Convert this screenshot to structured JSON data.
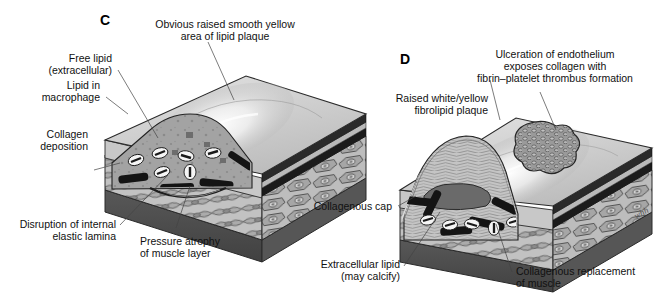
{
  "figure": {
    "signature": "whh",
    "colors": {
      "background": "#ffffff",
      "top_surface_light": "#e8e8e8",
      "top_surface_mid": "#c9c9c9",
      "highlight": "#fdfdfd",
      "muscle_layer": "#b5b5b5",
      "muscle_cell": "#9a9a9a",
      "adventitia_base": "#4a4a4a",
      "side_face": "#a8a8a8",
      "elastic_lamina_dark": "#1c1c1c",
      "lipid_core": "#9d9d9d",
      "foam_cell": "#f4f4f4",
      "extracellular_lipid": "#6e6e6e",
      "thrombus": "#8e8e8e",
      "text": "#111111",
      "leader_line": "#444444"
    }
  },
  "panels": [
    {
      "id": "C",
      "letter": "C",
      "labels": [
        {
          "id": "obvious-raised-plaque",
          "lines": [
            "Obvious raised smooth yellow",
            "area of lipid plaque"
          ],
          "align": "middle"
        },
        {
          "id": "free-lipid",
          "lines": [
            "Free lipid",
            "(extracellular)"
          ],
          "align": "end"
        },
        {
          "id": "lipid-in-macrophage",
          "lines": [
            "Lipid in",
            "macrophage"
          ],
          "align": "end"
        },
        {
          "id": "collagen-deposition",
          "lines": [
            "Collagen",
            "deposition"
          ],
          "align": "end"
        },
        {
          "id": "disruption-elastic-lamina",
          "lines": [
            "Disruption of internal",
            "elastic lamina"
          ],
          "align": "end"
        },
        {
          "id": "pressure-atrophy",
          "lines": [
            "Pressure atrophy",
            "of muscle layer"
          ],
          "align": "start"
        }
      ]
    },
    {
      "id": "D",
      "letter": "D",
      "labels": [
        {
          "id": "ulceration-endothelium",
          "lines": [
            "Ulceration of endothelium",
            "exposes collagen with",
            "fibrin–platelet thrombus formation"
          ],
          "align": "middle"
        },
        {
          "id": "raised-fibrolipid-plaque",
          "lines": [
            "Raised white/yellow",
            "fibrolipid plaque"
          ],
          "align": "end"
        },
        {
          "id": "collagenous-cap",
          "lines": [
            "Collagenous cap"
          ],
          "align": "end"
        },
        {
          "id": "extracellular-lipid",
          "lines": [
            "Extracellular lipid",
            "(may calcify)"
          ],
          "align": "end"
        },
        {
          "id": "collagenous-replacement",
          "lines": [
            "Collagenous replacement",
            "of muscle"
          ],
          "align": "start"
        }
      ]
    }
  ]
}
